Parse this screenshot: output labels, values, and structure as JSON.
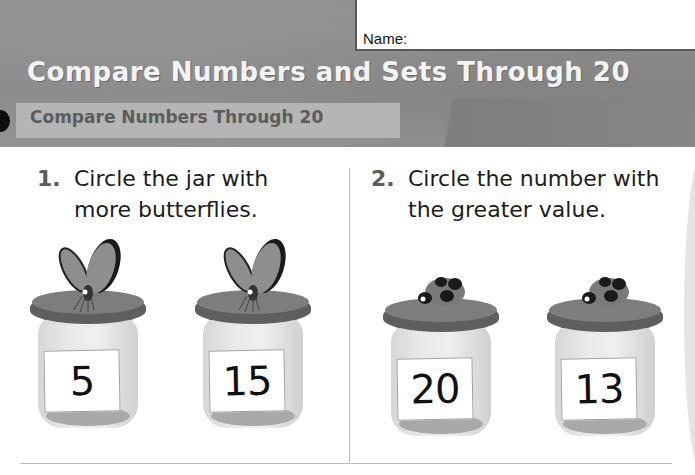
{
  "header": {
    "name_label": "Name:",
    "title": "Compare Numbers and Sets Through 20",
    "subtitle": "Compare Numbers Through 20"
  },
  "questions": [
    {
      "number": "1.",
      "text": "Circle the jar with\nmore butterflies.",
      "jars": [
        {
          "value": "5",
          "insect": "butterfly-icon"
        },
        {
          "value": "15",
          "insect": "butterfly-icon"
        }
      ]
    },
    {
      "number": "2.",
      "text": "Circle the number with\nthe greater value.",
      "jars": [
        {
          "value": "20",
          "insect": "ladybug-icon"
        },
        {
          "value": "13",
          "insect": "ladybug-icon"
        }
      ]
    }
  ],
  "colors": {
    "header_bg": "#8c8c8c",
    "title_text": "#f3f3f3",
    "subtitle_band": "#b5b5b5",
    "subtitle_text": "#5c5c5c",
    "lid": "#5e5e5e",
    "jar_glass": "#e6e6e6"
  }
}
